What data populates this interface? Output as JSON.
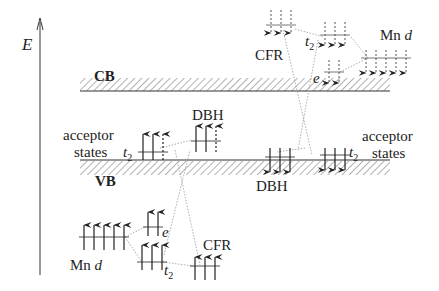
{
  "axis": {
    "label": "E"
  },
  "bands": {
    "cb": {
      "label": "CB"
    },
    "vb": {
      "label": "VB"
    }
  },
  "labels": {
    "acceptor_left_1": "acceptor",
    "acceptor_left_2": "states",
    "acceptor_right_1": "acceptor",
    "acceptor_right_2": "states",
    "dbh_up": "DBH",
    "dbh_down": "DBH",
    "cfr_up": "CFR",
    "cfr_down": "CFR",
    "mn_d_up_prefix": "Mn",
    "mn_d_up_var": "d",
    "mn_d_down_prefix": "Mn",
    "mn_d_down_var": "d",
    "e_up": "e",
    "e_down": "e",
    "t2_acc_left": "t",
    "t2_acc_right": "t",
    "t2_up": "t",
    "t2_down": "t",
    "sub2": "2"
  },
  "colors": {
    "ink": "#222222",
    "hatch": "#555555",
    "dotted": "#888888"
  }
}
